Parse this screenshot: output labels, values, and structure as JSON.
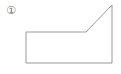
{
  "figure": {
    "label": "①",
    "shape": {
      "type": "polygon",
      "points": [
        [
          26,
          32
        ],
        [
          86,
          32
        ],
        [
          112,
          5
        ],
        [
          112,
          63
        ],
        [
          26,
          63
        ]
      ],
      "stroke": "#999999",
      "fill": "none"
    }
  }
}
